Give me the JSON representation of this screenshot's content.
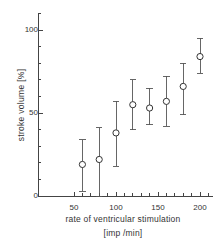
{
  "chart_data": {
    "type": "scatter",
    "title": "",
    "xlabel": "rate of ventricular stimulation",
    "xlabel_units": "[imp /min]",
    "ylabel": "stroke volume [%]",
    "xlim": [
      25,
      215
    ],
    "ylim": [
      0,
      110
    ],
    "grid": false,
    "legend": null,
    "x_ticks_major": [
      50,
      100,
      150,
      200
    ],
    "x_ticks_minor": [
      60,
      70,
      80,
      90,
      110,
      120,
      130,
      140,
      160,
      170,
      180,
      190,
      210
    ],
    "x_tick_labels": [
      "50",
      "100",
      "150",
      "200"
    ],
    "y_ticks_major": [
      0,
      50,
      100
    ],
    "y_ticks_minor": [
      10,
      20,
      30,
      40,
      60,
      70,
      80,
      90,
      110
    ],
    "y_tick_labels": [
      "0",
      "50",
      "100"
    ],
    "marker": "open-circle",
    "errorbars": "vertical-with-caps",
    "x": [
      60,
      80,
      100,
      120,
      140,
      160,
      180,
      200
    ],
    "values": [
      19,
      22,
      38,
      55,
      53,
      57,
      66,
      84
    ],
    "err_low": [
      3,
      0,
      18,
      40,
      43,
      42,
      49,
      74
    ],
    "err_high": [
      34,
      41,
      57,
      70,
      65,
      72,
      80,
      95
    ],
    "points": [
      {
        "x": 60,
        "y": 19,
        "low": 3,
        "high": 34
      },
      {
        "x": 80,
        "y": 22,
        "low": 0,
        "high": 41
      },
      {
        "x": 100,
        "y": 38,
        "low": 18,
        "high": 57
      },
      {
        "x": 120,
        "y": 55,
        "low": 40,
        "high": 70
      },
      {
        "x": 140,
        "y": 53,
        "low": 43,
        "high": 65
      },
      {
        "x": 160,
        "y": 57,
        "low": 42,
        "high": 72
      },
      {
        "x": 180,
        "y": 66,
        "low": 49,
        "high": 80
      },
      {
        "x": 200,
        "y": 84,
        "low": 74,
        "high": 95
      }
    ],
    "colors": {
      "axis": "#444444",
      "marker": "#333333",
      "errorbar": "#555555",
      "background": "#ffffff",
      "text": "#333333"
    }
  }
}
